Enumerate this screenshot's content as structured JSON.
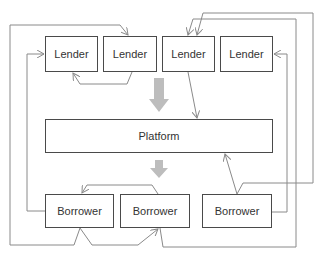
{
  "lenders": [
    {
      "label": "Lender"
    },
    {
      "label": "Lender"
    },
    {
      "label": "Lender"
    },
    {
      "label": "Lender"
    }
  ],
  "platform": {
    "label": "Platform"
  },
  "borrowers": [
    {
      "label": "Borrower"
    },
    {
      "label": "Borrower"
    },
    {
      "label": "Borrower"
    }
  ],
  "colors": {
    "box_border": "#4a4a4a",
    "connector": "#8a8a8a",
    "flow_arrow": "#bdbdbd"
  }
}
